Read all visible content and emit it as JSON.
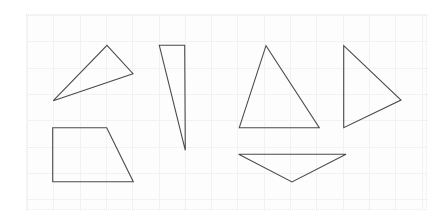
{
  "canvas": {
    "width": 438,
    "height": 221,
    "background_color": "#ffffff"
  },
  "panel": {
    "name": "shape-grid-panel",
    "x": 26,
    "y": 14,
    "width": 401,
    "height": 196,
    "background_color": "#fdfdfe",
    "border_color": "#ebebee",
    "border_style": "dotted",
    "border_width": 1,
    "grid": {
      "visible": true,
      "spacing": 26.3,
      "line_color": "#f2f2f5",
      "line_width": 1
    }
  },
  "shapes": {
    "stroke_color": "#4a4a4a",
    "stroke_width": 1.1,
    "fill": "none",
    "items": [
      {
        "name": "obtuse-triangle-upper-left",
        "type": "triangle",
        "label": "Triangle 1",
        "points": "106,44.3 132,72.7 52.3,99.7"
      },
      {
        "name": "trapezoid-lower-left",
        "type": "trapezoid",
        "label": "Trapezoid",
        "points": "51.7,126.7 105.7,126.7 132.3,180.7 51.7,180.7"
      },
      {
        "name": "thin-sliver-triangle",
        "type": "triangle",
        "label": "Triangle 2",
        "points": "158.3,44.3 183.7,44.3 184.3,149.3"
      },
      {
        "name": "isosceles-triangle-upright",
        "type": "triangle",
        "label": "Triangle 3",
        "points": "265,44.7 318.3,126.7 238.3,126.7"
      },
      {
        "name": "flat-triangle-pointing-down",
        "type": "triangle",
        "label": "Triangle 4",
        "points": "237.7,153.3 345,153.3 291,181"
      },
      {
        "name": "right-triangle-pointing-right",
        "type": "triangle",
        "label": "Triangle 5",
        "points": "342.7,44.7 400,99 342.7,126.7"
      }
    ]
  }
}
